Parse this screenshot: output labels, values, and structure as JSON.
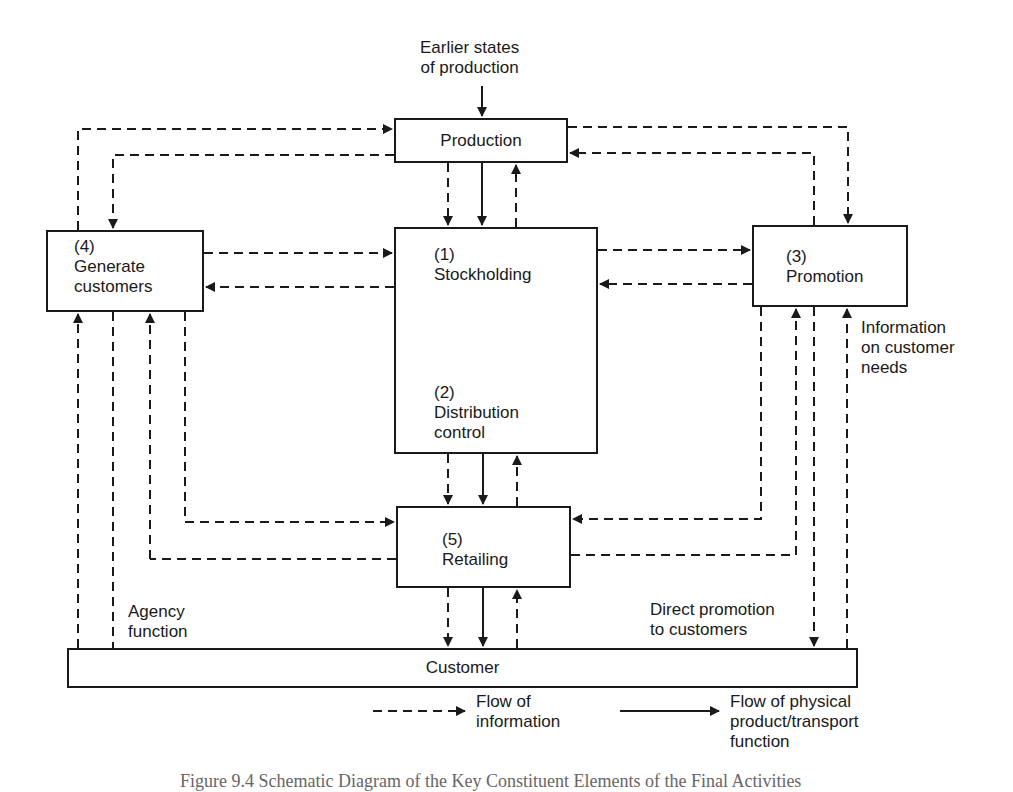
{
  "diagram": {
    "top_input": {
      "line1": "Earlier states",
      "line2": "of production"
    },
    "nodes": {
      "production": {
        "label": "Production"
      },
      "stockholding": {
        "number": "(1)",
        "label": "Stockholding"
      },
      "distribution": {
        "number": "(2)",
        "label_line1": "Distribution",
        "label_line2": "control"
      },
      "promotion": {
        "number": "(3)",
        "label": "Promotion"
      },
      "generate": {
        "number": "(4)",
        "label_line1": "Generate",
        "label_line2": "customers"
      },
      "retailing": {
        "number": "(5)",
        "label": "Retailing"
      },
      "customer": {
        "label": "Customer"
      }
    },
    "annotations": {
      "info_needs": {
        "line1": "Information",
        "line2": "on customer",
        "line3": "needs"
      },
      "agency": {
        "line1": "Agency",
        "line2": "function"
      },
      "direct_promo": {
        "line1": "Direct promotion",
        "line2": "to customers"
      }
    },
    "legend": {
      "information": {
        "line1": "Flow of",
        "line2": "information"
      },
      "physical": {
        "line1": "Flow of physical",
        "line2": "product/transport",
        "line3": "function"
      }
    },
    "caption": "Figure 9.4 Schematic Diagram of the Key Constituent Elements of the Final Activities",
    "colors": {
      "ink": "#1a1a1a",
      "paper": "#ffffff"
    }
  }
}
